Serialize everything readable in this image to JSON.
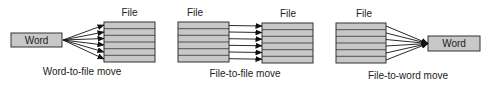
{
  "colors": {
    "box_fill": "#c8c8c8",
    "stroke": "#333333",
    "background": "#ffffff"
  },
  "panels": [
    {
      "caption": "Word-to-file move",
      "word_label": "Word",
      "file_label": "File",
      "rows": 6
    },
    {
      "caption": "File-to-file move",
      "source_file_label": "File",
      "target_file_label": "File",
      "rows": 6
    },
    {
      "caption": "File-to-word move",
      "file_label": "File",
      "word_label": "Word",
      "rows": 6
    }
  ]
}
